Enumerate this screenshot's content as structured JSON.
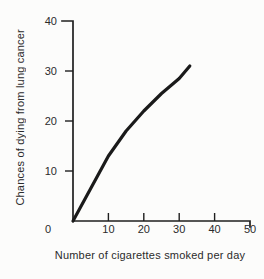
{
  "chart_data": {
    "type": "line",
    "title": "",
    "xlabel": "Number of cigarettes smoked per day",
    "ylabel": "Chances of dying from lung cancer",
    "xlim": [
      0,
      50
    ],
    "ylim": [
      0,
      40
    ],
    "xticks": [
      0,
      10,
      20,
      30,
      40,
      50
    ],
    "yticks": [
      0,
      10,
      20,
      30,
      40
    ],
    "grid": false,
    "legend": false,
    "series": [
      {
        "name": "lung-cancer-risk-curve",
        "x": [
          0,
          5,
          10,
          15,
          20,
          25,
          30,
          33
        ],
        "y": [
          0,
          6.5,
          13,
          18,
          22,
          25.5,
          28.5,
          31
        ]
      }
    ],
    "line_color": "#1a1a1a",
    "axis_color": "#1f1f1f",
    "text_color": "#2b2b2b",
    "background_color": "#fcfcfb"
  }
}
